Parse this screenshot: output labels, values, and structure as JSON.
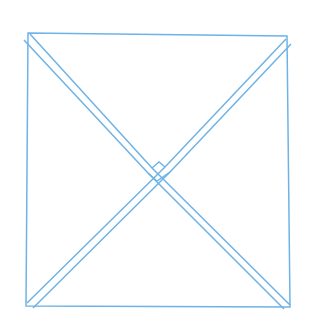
{
  "canvas": {
    "width": 315,
    "height": 327,
    "background_color": "#ffffff",
    "title": "square-with-double-stroked-diagonals"
  },
  "style": {
    "line_color": "#6fb3e6",
    "line_color_soft": "#8ec4ec",
    "line_color_faint": "#aed5f2",
    "stroke_width": 1.5,
    "stroke_width_thin": 1.3
  },
  "figure": {
    "type": "line-drawing",
    "shapes": [
      {
        "name": "square-outline",
        "kind": "polygon",
        "closed": true,
        "points": "28,33 287,36 290,307 26,306",
        "color": "#6fb3e6",
        "width": 1.5
      },
      {
        "name": "diagonal-tl-br-upper",
        "kind": "polyline",
        "closed": false,
        "points": "30,34 152,168 290,305",
        "color": "#6fb3e6",
        "width": 1.5
      },
      {
        "name": "diagonal-tl-br-lower",
        "kind": "polyline",
        "closed": false,
        "points": "24,40 148,173 284,309",
        "color": "#6fb3e6",
        "width": 1.5
      },
      {
        "name": "diagonal-tr-bl-upper",
        "kind": "polyline",
        "closed": false,
        "points": "286,39 165,167 27,303",
        "color": "#6fb3e6",
        "width": 1.5
      },
      {
        "name": "diagonal-tr-bl-lower",
        "kind": "polyline",
        "closed": false,
        "points": "291,44 170,172 33,308",
        "color": "#6fb3e6",
        "width": 1.5
      },
      {
        "name": "center-notch-left",
        "kind": "polyline",
        "closed": false,
        "points": "148,173 157,181 170,172",
        "color": "#6fb3e6",
        "width": 1.4
      },
      {
        "name": "center-notch-top",
        "kind": "polyline",
        "closed": false,
        "points": "152,168 159,162 165,167",
        "color": "#6fb3e6",
        "width": 1.4
      }
    ],
    "corners": [
      {
        "name": "top-left",
        "x": 28,
        "y": 33
      },
      {
        "name": "top-right",
        "x": 287,
        "y": 36
      },
      {
        "name": "bottom-right",
        "x": 290,
        "y": 307
      },
      {
        "name": "bottom-left",
        "x": 26,
        "y": 306
      }
    ],
    "crossing_point": {
      "name": "diagonal-crossing",
      "x": 159,
      "y": 171
    }
  }
}
